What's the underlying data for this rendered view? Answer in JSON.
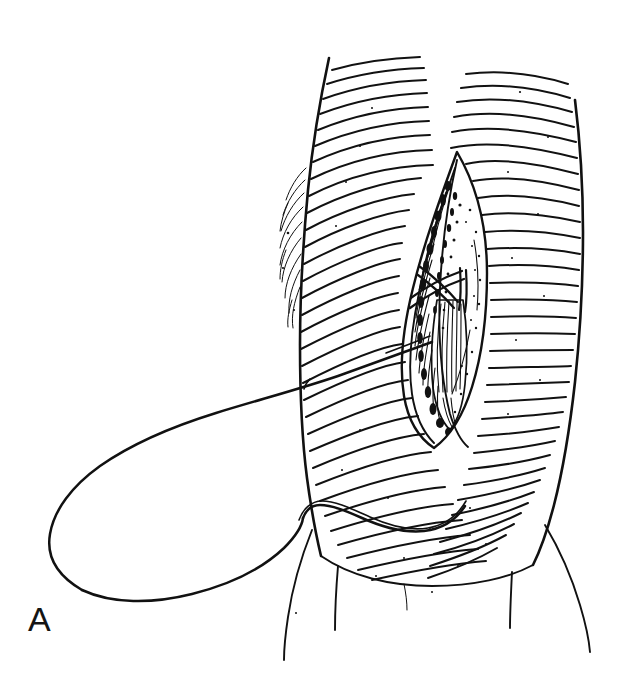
{
  "figure": {
    "panel_label": "A",
    "style": "pen-and-ink line art",
    "background_color": "#ffffff",
    "ink_color": "#111111"
  },
  "elements": {
    "body_surface_label": "rugated skin surface",
    "incision_label": "vertical surgical incision",
    "exposed_tissue_label": "exposed striated tissue",
    "suture_label": "suture thread loop",
    "left_leg_label": "left lower contour",
    "right_leg_label": "right lower contour"
  }
}
